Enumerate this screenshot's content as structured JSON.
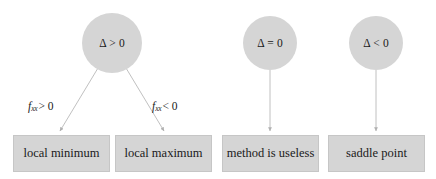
{
  "diagram": {
    "colors": {
      "node_fill": "#d5d5d5",
      "node_border": "#c6c6c6",
      "edge_stroke": "#b9b9b9",
      "text": "#1a1a1a",
      "background": "#ffffff"
    },
    "conditions": [
      {
        "id": "delta-positive",
        "label": "Δ > 0",
        "cx": 112,
        "cy": 43,
        "r": 30
      },
      {
        "id": "delta-zero",
        "label": "Δ = 0",
        "cx": 270,
        "cy": 43,
        "r": 27
      },
      {
        "id": "delta-negative",
        "label": "Δ < 0",
        "cx": 376,
        "cy": 43,
        "r": 27
      }
    ],
    "outcomes": [
      {
        "id": "local-minimum",
        "label": "local minimum",
        "x": 13,
        "y": 135,
        "w": 97,
        "h": 37
      },
      {
        "id": "local-maximum",
        "label": "local maximum",
        "x": 115,
        "y": 135,
        "w": 97,
        "h": 37
      },
      {
        "id": "method-is-useless",
        "label": "method is useless",
        "x": 222,
        "y": 135,
        "w": 97,
        "h": 37
      },
      {
        "id": "saddle-point",
        "label": "saddle point",
        "x": 328,
        "y": 135,
        "w": 97,
        "h": 37
      }
    ],
    "edge_labels": [
      {
        "id": "fxx-positive",
        "fn": "f",
        "sub": "xx",
        "op": "> 0",
        "x": 28,
        "y": 100
      },
      {
        "id": "fxx-negative",
        "fn": "f",
        "sub": "xx",
        "op": "< 0",
        "x": 152,
        "y": 100
      }
    ],
    "edges": [
      {
        "id": "edge-delta-positive-to-local-minimum",
        "x1": 98,
        "y1": 68,
        "x2": 60,
        "y2": 131
      },
      {
        "id": "edge-delta-positive-to-local-maximum",
        "x1": 126,
        "y1": 68,
        "x2": 164,
        "y2": 131
      },
      {
        "id": "edge-delta-zero-to-method-is-useless",
        "x1": 270,
        "y1": 70,
        "x2": 270,
        "y2": 131
      },
      {
        "id": "edge-delta-negative-to-saddle-point",
        "x1": 376,
        "y1": 70,
        "x2": 376,
        "y2": 131
      }
    ]
  }
}
